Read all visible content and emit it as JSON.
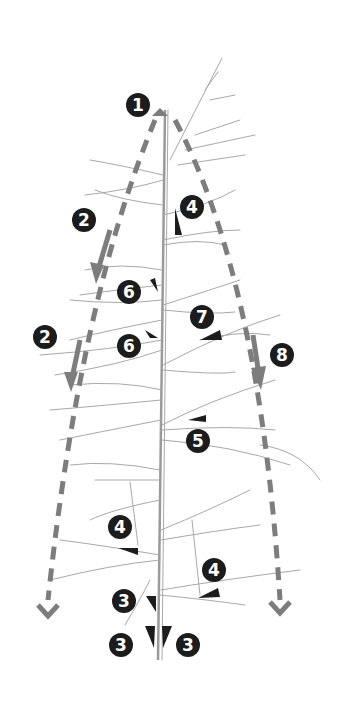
{
  "diagram": {
    "colors": {
      "badge": "#1c1c1c",
      "badge_text": "#ffffff",
      "arrow": "#7d7d7d",
      "branch": "#a8a8a8",
      "background": "#ffffff"
    },
    "badges": [
      {
        "label": "1",
        "x": 126,
        "y": 93
      },
      {
        "label": "2",
        "x": 72,
        "y": 208
      },
      {
        "label": "2",
        "x": 33,
        "y": 325
      },
      {
        "label": "4",
        "x": 180,
        "y": 195
      },
      {
        "label": "6",
        "x": 117,
        "y": 280
      },
      {
        "label": "6",
        "x": 117,
        "y": 334
      },
      {
        "label": "7",
        "x": 190,
        "y": 305
      },
      {
        "label": "8",
        "x": 270,
        "y": 343
      },
      {
        "label": "5",
        "x": 186,
        "y": 429
      },
      {
        "label": "4",
        "x": 108,
        "y": 515
      },
      {
        "label": "4",
        "x": 202,
        "y": 558
      },
      {
        "label": "3",
        "x": 112,
        "y": 589
      },
      {
        "label": "3",
        "x": 109,
        "y": 633
      },
      {
        "label": "3",
        "x": 176,
        "y": 633
      }
    ]
  }
}
